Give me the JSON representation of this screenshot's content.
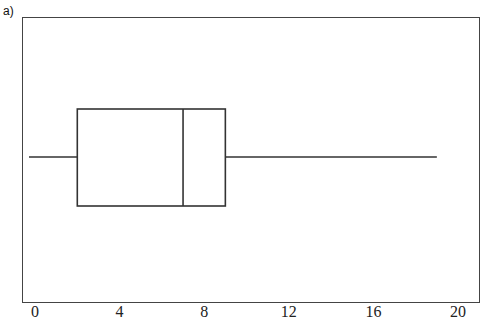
{
  "panel_label": "a)",
  "chart_data": {
    "type": "boxplot",
    "title": "",
    "xlabel": "",
    "ylabel": "",
    "orientation": "horizontal",
    "xlim": [
      0,
      20
    ],
    "xticks": [
      0,
      4,
      8,
      12,
      16,
      20
    ],
    "tick_labels": [
      "0",
      "4",
      "8",
      "12",
      "16",
      "20"
    ],
    "grid": false,
    "series": [
      {
        "name": "",
        "min": 0,
        "q1": 2,
        "median": 7,
        "q3": 9,
        "max": 19
      }
    ]
  },
  "colors": {
    "line": "#333333",
    "background": "#ffffff"
  }
}
